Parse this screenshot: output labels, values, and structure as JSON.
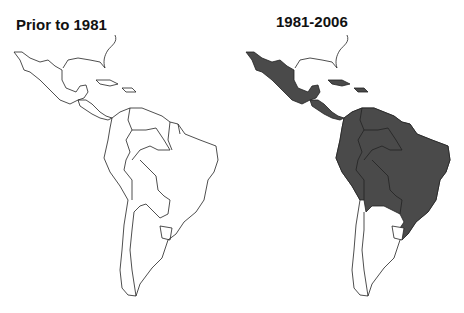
{
  "panels": [
    {
      "title": "Prior to 1981",
      "shaded_countries": []
    },
    {
      "title": "1981-2006",
      "shaded_countries": [
        "Mexico",
        "Guatemala",
        "Belize",
        "Honduras",
        "El Salvador",
        "Nicaragua",
        "Costa Rica",
        "Panama",
        "Cuba",
        "Haiti",
        "Dominican Republic",
        "Puerto Rico",
        "Colombia",
        "Venezuela",
        "Guyana",
        "Suriname",
        "French Guiana",
        "Ecuador",
        "Peru",
        "Bolivia",
        "Brazil",
        "Paraguay"
      ]
    }
  ],
  "colors": {
    "shaded": "#4a4a4a",
    "outline": "#222222",
    "background": "#ffffff"
  }
}
